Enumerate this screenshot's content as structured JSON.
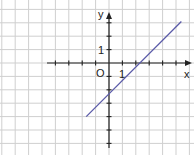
{
  "graph": {
    "axis_labels": {
      "x": "x",
      "y": "y",
      "origin": "O"
    },
    "tick_labels": {
      "x_one": "1",
      "y_one": "1"
    },
    "grid": {
      "unit_px": 13.4,
      "origin_px": [
        109,
        63
      ]
    },
    "line": {
      "color": "#5a5aa8",
      "from": [
        -1.7,
        -4.0
      ],
      "to": [
        5.4,
        3.1
      ]
    },
    "colors": {
      "grid": "#cfcfcf",
      "axis": "#222222",
      "line": "#5a5aa8"
    }
  },
  "chart_data": {
    "type": "line",
    "title": "",
    "xlabel": "x",
    "ylabel": "y",
    "series": [
      {
        "name": "line",
        "x": [
          -1.7,
          5.4
        ],
        "y": [
          -4.0,
          3.1
        ]
      }
    ],
    "x_intercept": 2.3,
    "y_intercept": -2.4,
    "grid": true
  }
}
